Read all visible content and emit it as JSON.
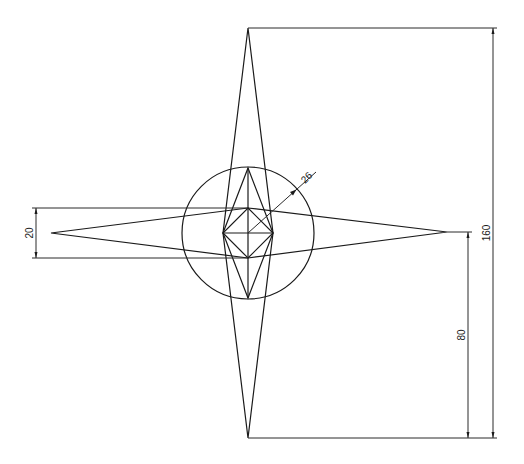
{
  "drawing": {
    "title": "Star with circle - technical drawing",
    "line_color": "#1a1a1a",
    "background": "#ffffff",
    "dimensions": {
      "overall_height": {
        "label": "160",
        "value": 160
      },
      "half_height": {
        "label": "80",
        "value": 80
      },
      "horizontal_width": {
        "label": "20",
        "value": 20
      },
      "circle_radius": {
        "label": "26",
        "value": 26
      }
    }
  }
}
